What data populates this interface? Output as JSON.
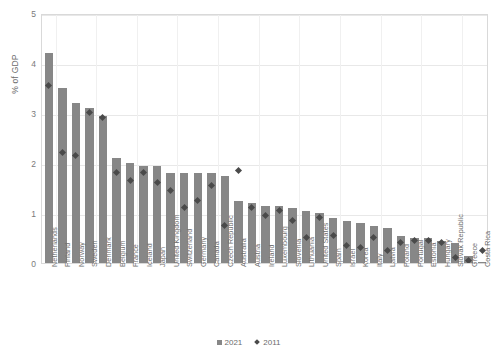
{
  "chart_data": {
    "type": "bar",
    "title": "",
    "subtitle": "",
    "xlabel": "",
    "ylabel": "% of GDP",
    "ylim": [
      0,
      5
    ],
    "yticks": [
      0,
      1,
      2,
      3,
      4,
      5
    ],
    "ytick_labels": [
      "0",
      "1",
      "2",
      "3",
      "4",
      "5"
    ],
    "grid": true,
    "legend_position": "bottom",
    "bar_color": "#878787",
    "marker_color": "#4a4a4a",
    "categories": [
      "Netherlands",
      "Finland",
      "Norway",
      "Sweden",
      "Denmark",
      "Belgium",
      "France",
      "Iceland",
      "Japan",
      "United Kingdom",
      "Switzerland",
      "Germany",
      "Canada",
      "Czech Republic",
      "Australia",
      "Austria",
      "Ireland",
      "Luxembourg",
      "Slovenia",
      "Lithuania",
      "United States",
      "Spain",
      "Israel",
      "Korea",
      "Italy",
      "Latvia",
      "Poland",
      "Portugal",
      "Estonia",
      "Hungary",
      "Slovak Republic",
      "Greece",
      "Costa Rica"
    ],
    "series": [
      {
        "name": "2021",
        "type": "bar",
        "values": [
          4.2,
          3.5,
          3.2,
          3.1,
          2.95,
          2.1,
          2.0,
          1.95,
          1.95,
          1.8,
          1.8,
          1.8,
          1.8,
          1.75,
          1.25,
          1.2,
          1.15,
          1.15,
          1.1,
          1.05,
          1.0,
          0.9,
          0.85,
          0.8,
          0.75,
          0.7,
          0.55,
          0.5,
          0.5,
          0.45,
          0.4,
          0.15,
          0.02
        ]
      },
      {
        "name": "2011",
        "type": "scatter",
        "marker": "diamond",
        "values": [
          3.6,
          2.25,
          2.2,
          3.05,
          2.95,
          1.85,
          1.7,
          1.85,
          1.65,
          1.5,
          1.15,
          1.3,
          1.6,
          0.8,
          1.9,
          1.15,
          1.0,
          1.1,
          0.9,
          0.55,
          0.95,
          0.6,
          0.4,
          0.35,
          0.55,
          0.3,
          0.45,
          0.5,
          0.5,
          0.45,
          0.15,
          0.1,
          0.3
        ]
      }
    ],
    "legend": [
      {
        "label": "2021",
        "marker": "square",
        "color": "#878787"
      },
      {
        "label": "2011",
        "marker": "diamond",
        "color": "#4a4a4a"
      }
    ]
  }
}
